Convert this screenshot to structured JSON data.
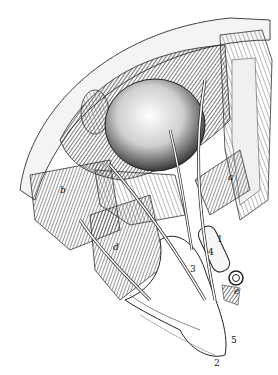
{
  "image": {
    "description": "Anatomical engraving of orbit dissection with eyeball, muscles, nerves and vessels",
    "colors": {
      "ink": "#111111",
      "paper": "#ffffff",
      "shade": "#555555",
      "light": "#dddddd"
    }
  },
  "labels": [
    {
      "text": "a",
      "x": 228,
      "y": 173,
      "italic": true
    },
    {
      "text": "b",
      "x": 60,
      "y": 186,
      "italic": true
    },
    {
      "text": "d",
      "x": 113,
      "y": 243,
      "italic": true
    },
    {
      "text": "1",
      "x": 217,
      "y": 235,
      "italic": false
    },
    {
      "text": "4",
      "x": 208,
      "y": 248,
      "italic": false
    },
    {
      "text": "3",
      "x": 190,
      "y": 265,
      "italic": false
    },
    {
      "text": "e",
      "x": 234,
      "y": 287,
      "italic": true
    },
    {
      "text": "5",
      "x": 231,
      "y": 336,
      "italic": false
    },
    {
      "text": "2",
      "x": 214,
      "y": 359,
      "italic": false
    }
  ]
}
